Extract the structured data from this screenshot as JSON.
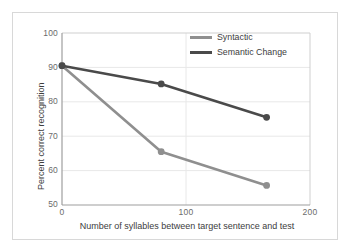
{
  "chart_data": {
    "type": "line",
    "title": "",
    "xlabel": "Number of syllables between target sentence and test",
    "ylabel": "Percent correct recognition",
    "xlim": [
      0,
      200
    ],
    "ylim": [
      50,
      100
    ],
    "xticks": [
      "0",
      "100",
      "200"
    ],
    "xtick_values": [
      0,
      100,
      200
    ],
    "yticks": [
      "50",
      "60",
      "70",
      "80",
      "90",
      "100"
    ],
    "ytick_values": [
      50,
      60,
      70,
      80,
      90,
      100
    ],
    "grid": "horizontal-and-vertical-light",
    "legend_position": "top-right-inside",
    "x": [
      0,
      80,
      165
    ],
    "series": [
      {
        "name": "Syntactic",
        "color": "#8f8f8f",
        "values": [
          90.5,
          65.5,
          55.7
        ],
        "marker": "circle"
      },
      {
        "name": "Semantic Change",
        "color": "#4a4a4a",
        "values": [
          90.5,
          85.2,
          75.5
        ],
        "marker": "circle"
      }
    ]
  },
  "legend": {
    "entries": [
      {
        "label": "Syntactic"
      },
      {
        "label": "Semantic Change"
      }
    ]
  },
  "axes": {
    "y_title": "Percent correct recognition",
    "x_title": "Number of syllables between target sentence and test",
    "y_labels": [
      "100",
      "90",
      "80",
      "70",
      "60",
      "50"
    ],
    "x_labels": [
      "0",
      "100",
      "200"
    ]
  },
  "colors": {
    "syntactic": "#8f8f8f",
    "semantic_change": "#4a4a4a",
    "axis": "#b0b0b0",
    "grid": "#e6e6e6",
    "frame": "#d8d8d8",
    "text": "#3d3d3d",
    "tick_text": "#6b6b6b"
  }
}
